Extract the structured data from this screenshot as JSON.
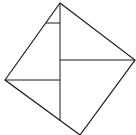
{
  "figure": {
    "label": "",
    "stroke_color": "#1a1a1a",
    "background": "#ffffff",
    "outer_square": {
      "vertices": [
        [
          60,
          3
        ],
        [
          135,
          60
        ],
        [
          80,
          135
        ],
        [
          5,
          80
        ]
      ]
    },
    "segments": [
      {
        "name": "vertical-line",
        "from": [
          60,
          3
        ],
        "to": [
          60,
          121
        ]
      },
      {
        "name": "right-horizontal-line",
        "from": [
          60,
          60
        ],
        "to": [
          135,
          60
        ]
      },
      {
        "name": "left-horizontal-line",
        "from": [
          5,
          80
        ],
        "to": [
          60,
          80
        ]
      },
      {
        "name": "small-horizontal-line",
        "from": [
          46,
          23
        ],
        "to": [
          60,
          23
        ]
      }
    ]
  }
}
